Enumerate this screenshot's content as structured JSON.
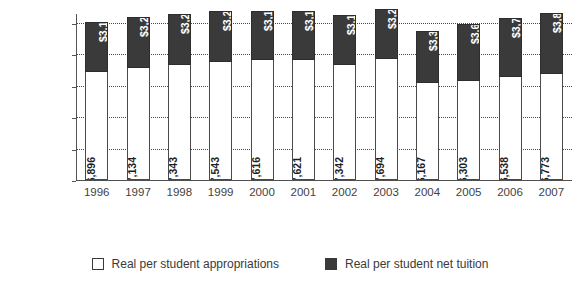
{
  "chart_data": {
    "type": "bar",
    "subtype": "stacked-vertical",
    "title": "",
    "xlabel": "",
    "ylabel": "",
    "categories": [
      "1996",
      "1997",
      "1998",
      "1999",
      "2000",
      "2001",
      "2002",
      "2003",
      "2004",
      "2005",
      "2006",
      "2007"
    ],
    "series": [
      {
        "name": "Real per student appropriations",
        "color": "#ffffff",
        "border": "#4a4a4a",
        "values": [
          6896,
          7134,
          7343,
          7543,
          7616,
          7621,
          7342,
          7694,
          6167,
          6303,
          6538,
          6773
        ],
        "labels": [
          "$6,896",
          "$7,134",
          "$7,343",
          "$7,543",
          "$7,616",
          "$7,621",
          "$7,342",
          "$7,694",
          "$6,167",
          "$6,303",
          "$6,538",
          "$6,773"
        ]
      },
      {
        "name": "Real per student net tuition",
        "color": "#3a3a3a",
        "border": "#2d2d2d",
        "values": [
          3195,
          3232,
          3242,
          3248,
          3162,
          3147,
          3154,
          3219,
          3310,
          3617,
          3766,
          3845
        ],
        "labels": [
          "$3,195",
          "$3,232",
          "$3,242",
          "$3,248",
          "$3,162",
          "$3,147",
          "$3,154",
          "$3,219",
          "$3,310",
          "$3,617",
          "$3,766",
          "$3,845"
        ]
      }
    ],
    "totals": [
      10091,
      10366,
      10585,
      10791,
      10778,
      10768,
      10496,
      10913,
      9477,
      9920,
      10304,
      10618
    ],
    "ylim": [
      0,
      10000
    ],
    "ytick_values": [
      0,
      2000,
      4000,
      6000,
      8000,
      10000
    ],
    "ytick_labels": [
      "$0",
      "$2,000",
      "$4,000",
      "$6,000",
      "$8,000",
      "$10,000"
    ],
    "grid": true,
    "grid_style": "dotted",
    "legend_position": "bottom-center"
  },
  "legend": {
    "items": [
      {
        "label": "Real per student appropriations",
        "swatch": "white"
      },
      {
        "label": "Real per student net tuition",
        "swatch": "dark"
      }
    ]
  }
}
